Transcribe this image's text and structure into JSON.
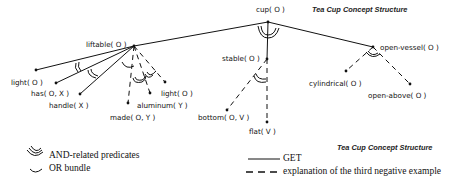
{
  "diagram": {
    "title_top": "Tea Cup Concept Structure",
    "title_bottom": "Tea Cup Concept Structure",
    "nodes": {
      "cup": "cup( O )",
      "liftable": "liftable( O )",
      "stable": "stable( O )",
      "open_vessel": "open-vessel( O )",
      "light_1": "light( O )",
      "has": "has( O, X )",
      "handle": "handle( X )",
      "made": "made( O, Y )",
      "aluminum": "aluminum( Y )",
      "light_2": "light( O )",
      "bottom": "bottom( O, V )",
      "flat": "flat( V )",
      "cylindrical": "cylindrical( O )",
      "open_above": "open-above( O )"
    }
  },
  "legend": {
    "and_label": "AND-related predicates",
    "or_label": "OR bundle",
    "solid_label": "GET",
    "dashed_label": "explanation of the third negative example"
  }
}
